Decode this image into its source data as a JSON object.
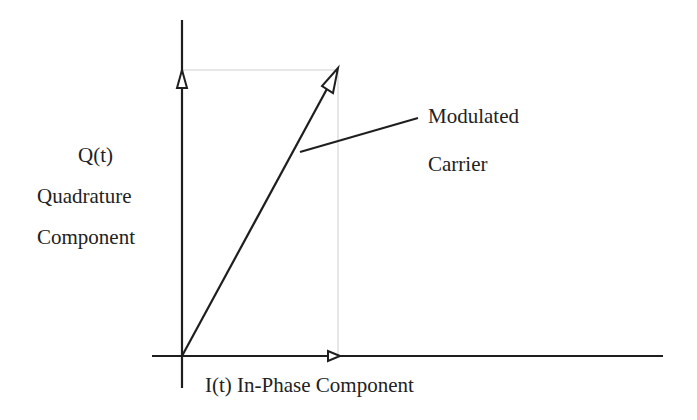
{
  "diagram": {
    "labels": {
      "q_axis_symbol": "Q(t)",
      "q_axis_name_line1": "Quadrature",
      "q_axis_name_line2": "Component",
      "i_axis": "I(t) In-Phase Component",
      "carrier_line1": "Modulated",
      "carrier_line2": "Carrier"
    },
    "colors": {
      "stroke": "#1e1e1e",
      "guide": "#c8c8c8",
      "text": "#222222"
    }
  }
}
